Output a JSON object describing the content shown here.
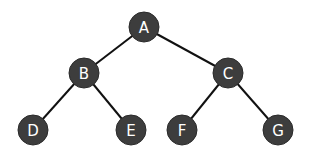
{
  "diagram": {
    "type": "binary-tree",
    "colors": {
      "node_fill": "#3d3d3d",
      "edge": "#111111",
      "label": "#ffffff",
      "background": "#ffffff"
    },
    "node_radius": 15,
    "nodes": [
      {
        "id": "A",
        "label": "A",
        "x": 144,
        "y": 27
      },
      {
        "id": "B",
        "label": "B",
        "x": 84,
        "y": 73
      },
      {
        "id": "C",
        "label": "C",
        "x": 228,
        "y": 73
      },
      {
        "id": "D",
        "label": "D",
        "x": 33,
        "y": 130
      },
      {
        "id": "E",
        "label": "E",
        "x": 131,
        "y": 130
      },
      {
        "id": "F",
        "label": "F",
        "x": 182,
        "y": 130
      },
      {
        "id": "G",
        "label": "G",
        "x": 278,
        "y": 130
      }
    ],
    "edges": [
      {
        "from": "A",
        "to": "B"
      },
      {
        "from": "A",
        "to": "C"
      },
      {
        "from": "B",
        "to": "D"
      },
      {
        "from": "B",
        "to": "E"
      },
      {
        "from": "C",
        "to": "F"
      },
      {
        "from": "C",
        "to": "G"
      }
    ]
  }
}
